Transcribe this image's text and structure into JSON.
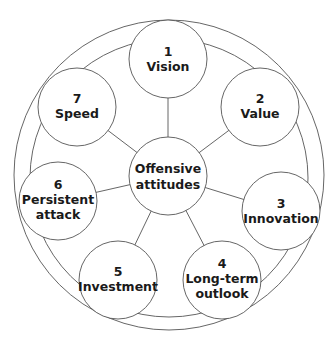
{
  "diagram": {
    "type": "hub-and-spoke",
    "center": {
      "lines": [
        "Offensive",
        "attitudes"
      ]
    },
    "nodes": [
      {
        "number": "1",
        "lines": [
          "1",
          "Vision"
        ]
      },
      {
        "number": "2",
        "lines": [
          "2",
          "Value"
        ]
      },
      {
        "number": "3",
        "lines": [
          "3",
          "Innovation"
        ]
      },
      {
        "number": "4",
        "lines": [
          "4",
          "Long-term",
          "outlook"
        ]
      },
      {
        "number": "5",
        "lines": [
          "5",
          "Investment"
        ]
      },
      {
        "number": "6",
        "lines": [
          "6",
          "Persistent",
          "attack"
        ]
      },
      {
        "number": "7",
        "lines": [
          "7",
          "Speed"
        ]
      }
    ],
    "colors": {
      "stroke": "#555555",
      "text": "#1a1a1a",
      "background": "#ffffff"
    }
  }
}
